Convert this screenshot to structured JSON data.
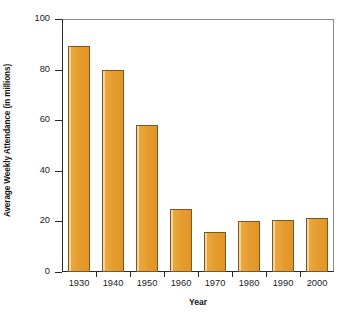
{
  "chart_data": {
    "type": "bar",
    "title": "",
    "xlabel": "Year",
    "ylabel": "Average Weekly Attendance (in millions)",
    "categories": [
      "1930",
      "1940",
      "1950",
      "1960",
      "1970",
      "1980",
      "1990",
      "2000"
    ],
    "values": [
      89.5,
      80,
      58,
      25,
      16,
      20,
      20.5,
      21.5
    ],
    "ylim": [
      0,
      100
    ],
    "yticks": [
      "0",
      "20",
      "40",
      "60",
      "80",
      "100"
    ],
    "ytick_values": [
      0,
      20,
      40,
      60,
      80,
      100
    ],
    "grid": false,
    "legend": null,
    "bar_color": "#e59a2c",
    "bar_edge_color": "#7d5526",
    "axis_color": "#2a2a2a",
    "background": "#ffffff"
  }
}
